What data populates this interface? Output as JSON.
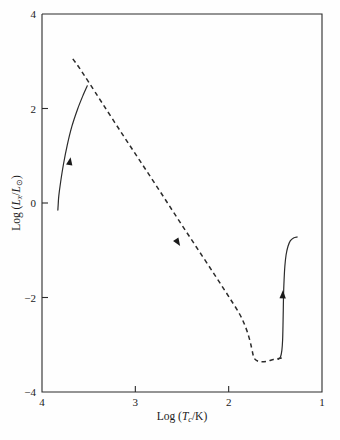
{
  "chart_data": {
    "type": "line",
    "title": "",
    "xlabel": "Log (Tc/K)",
    "ylabel": "Log (Lx/Lsun)",
    "xlabel_parts": {
      "prefix": "Log (",
      "symbol": "T",
      "subscript": "c",
      "suffix": "/K)"
    },
    "ylabel_parts": {
      "prefix": "Log (",
      "symbol": "L",
      "subscript": "x",
      "divider": "/",
      "symbol2": "L",
      "subscript2": "⊙",
      "suffix": ")"
    },
    "xlim": [
      4,
      1
    ],
    "ylim": [
      -4,
      4
    ],
    "x_ticks": [
      "4",
      "3",
      "2",
      "1"
    ],
    "x_tick_values": [
      4,
      3,
      2,
      1
    ],
    "y_ticks": [
      "4",
      "2",
      "0",
      "-2",
      "-4"
    ],
    "y_tick_values": [
      4,
      2,
      0,
      -2,
      -4
    ],
    "x_axis_inverted": true,
    "grid": false,
    "legend": "none",
    "series": [
      {
        "name": "contraction-branch",
        "style": "solid",
        "arrow": true,
        "arrow_at": [
          3.7,
          0.9
        ],
        "points": [
          [
            3.83,
            -0.15
          ],
          [
            3.827,
            -0.05
          ],
          [
            3.82,
            0.15
          ],
          [
            3.8,
            0.45
          ],
          [
            3.77,
            0.82
          ],
          [
            3.73,
            1.22
          ],
          [
            3.68,
            1.62
          ],
          [
            3.62,
            1.98
          ],
          [
            3.56,
            2.28
          ],
          [
            3.515,
            2.48
          ]
        ]
      },
      {
        "name": "cooling-track",
        "style": "dashed",
        "arrow": true,
        "arrow_at": [
          2.54,
          -0.85
        ],
        "points": [
          [
            3.67,
            3.05
          ],
          [
            3.6,
            2.86
          ],
          [
            3.5,
            2.56
          ],
          [
            3.35,
            2.1
          ],
          [
            3.15,
            1.49
          ],
          [
            2.95,
            0.89
          ],
          [
            2.75,
            0.29
          ],
          [
            2.55,
            -0.32
          ],
          [
            2.35,
            -0.92
          ],
          [
            2.15,
            -1.52
          ],
          [
            1.98,
            -2.04
          ],
          [
            1.88,
            -2.36
          ],
          [
            1.82,
            -2.62
          ],
          [
            1.78,
            -2.86
          ],
          [
            1.755,
            -3.06
          ],
          [
            1.74,
            -3.2
          ],
          [
            1.725,
            -3.29
          ],
          [
            1.69,
            -3.345
          ],
          [
            1.64,
            -3.36
          ],
          [
            1.58,
            -3.345
          ],
          [
            1.52,
            -3.31
          ],
          [
            1.46,
            -3.29
          ],
          [
            1.42,
            -3.28
          ]
        ]
      },
      {
        "name": "ascent-branch",
        "style": "solid",
        "arrow": true,
        "arrow_at": [
          1.42,
          -1.92
        ],
        "points": [
          [
            1.47,
            -3.31
          ],
          [
            1.445,
            -3.26
          ],
          [
            1.43,
            -3.12
          ],
          [
            1.422,
            -2.9
          ],
          [
            1.418,
            -2.6
          ],
          [
            1.415,
            -2.28
          ],
          [
            1.412,
            -1.94
          ],
          [
            1.406,
            -1.62
          ],
          [
            1.398,
            -1.34
          ],
          [
            1.385,
            -1.1
          ],
          [
            1.365,
            -0.92
          ],
          [
            1.34,
            -0.8
          ],
          [
            1.305,
            -0.74
          ],
          [
            1.265,
            -0.72
          ]
        ]
      }
    ]
  },
  "axes": {
    "frame_color": "#2b2b2b",
    "line_color": "#2b2b2b"
  },
  "caption": {
    "text": ""
  }
}
